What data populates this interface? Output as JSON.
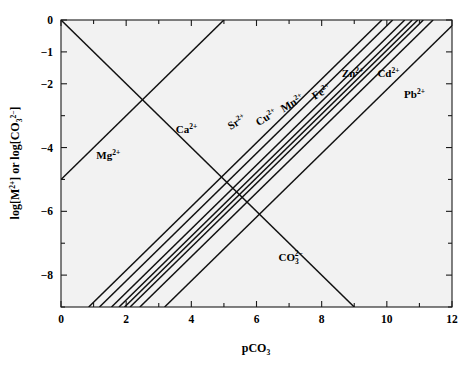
{
  "chart_data": {
    "type": "line",
    "title": "",
    "xlabel": "pCO3",
    "ylabel": "log[M2+] or log[CO3 2-]",
    "xlim": [
      0,
      12
    ],
    "ylim": [
      -9,
      0
    ],
    "grid": false,
    "legend": "inline-annotations",
    "xticks": [
      0,
      2,
      4,
      6,
      8,
      10,
      12
    ],
    "xtick_labels": [
      "0",
      "2",
      "4",
      "6",
      "8",
      "10",
      "12"
    ],
    "xminor_ticks": [
      1,
      3,
      5,
      7,
      9,
      11
    ],
    "yticks": [
      0,
      -1,
      -2,
      -4,
      -6,
      -8
    ],
    "ytick_labels": [
      "0",
      "−1",
      "−2",
      "−4",
      "−6",
      "−8"
    ],
    "yminor_ticks": [
      -3,
      -5,
      -7,
      -9
    ],
    "series": [
      {
        "name": "Mg2+",
        "label": "Mg",
        "charge": "2+",
        "slope": 1,
        "x_intercept": -5.0,
        "points": [
          [
            0,
            -5.0
          ],
          [
            9.0,
            0.0
          ]
        ],
        "label_pos": [
          1.45,
          -4.35
        ],
        "label_rotation": 0
      },
      {
        "name": "Ca2+",
        "label": "Ca",
        "charge": "2+",
        "slope": 1,
        "x_intercept": 0.85,
        "points": [
          [
            0.85,
            -9.0
          ],
          [
            9.85,
            0.0
          ]
        ],
        "label_pos": [
          3.85,
          -3.55
        ],
        "label_rotation": 0
      },
      {
        "name": "Sr2+",
        "label": "Sr",
        "charge": "2+",
        "slope": 1,
        "x_intercept": 1.18,
        "points": [
          [
            1.18,
            -9.0
          ],
          [
            10.18,
            0.0
          ]
        ],
        "label_pos": [
          5.45,
          -3.3
        ],
        "label_rotation": -31
      },
      {
        "name": "Cu2+",
        "label": "Cu",
        "charge": "2+",
        "slope": 1,
        "x_intercept": 1.55,
        "points": [
          [
            1.55,
            -9.0
          ],
          [
            10.55,
            0.0
          ]
        ],
        "label_pos": [
          6.35,
          -3.15
        ],
        "label_rotation": -31
      },
      {
        "name": "Mn2+",
        "label": "Mn",
        "charge": "2+",
        "slope": 1,
        "x_intercept": 1.78,
        "points": [
          [
            1.78,
            -9.0
          ],
          [
            10.78,
            0.0
          ]
        ],
        "label_pos": [
          7.15,
          -2.7
        ],
        "label_rotation": -31
      },
      {
        "name": "Fe2+",
        "label": "Fe",
        "charge": "2+",
        "slope": 1,
        "x_intercept": 1.95,
        "points": [
          [
            1.95,
            -9.0
          ],
          [
            10.95,
            0.0
          ]
        ],
        "label_pos": [
          8.05,
          -2.35
        ],
        "label_rotation": -31
      },
      {
        "name": "Zn2+",
        "label": "Zn",
        "charge": "2+",
        "slope": 1,
        "x_intercept": 2.12,
        "points": [
          [
            2.12,
            -9.0
          ],
          [
            11.12,
            0.0
          ]
        ],
        "label_pos": [
          8.95,
          -1.8
        ],
        "label_rotation": 0
      },
      {
        "name": "Cd2+",
        "label": "Cd",
        "charge": "2+",
        "slope": 1,
        "x_intercept": 2.42,
        "points": [
          [
            2.42,
            -9.0
          ],
          [
            11.42,
            0.0
          ]
        ],
        "label_pos": [
          10.05,
          -1.8
        ],
        "label_rotation": 0
      },
      {
        "name": "Pb2+",
        "label": "Pb",
        "charge": "2+",
        "slope": 1,
        "x_intercept": 3.18,
        "points": [
          [
            3.18,
            -9.0
          ],
          [
            12.0,
            -0.18
          ]
        ],
        "label_pos": [
          10.85,
          -2.45
        ],
        "label_rotation": 0
      },
      {
        "name": "CO3 2-",
        "label": "CO",
        "charge": "2−",
        "subscript": "3",
        "slope": -1,
        "x_intercept": 0.0,
        "points": [
          [
            0.0,
            0.0
          ],
          [
            9.0,
            -9.0
          ]
        ],
        "label_pos": [
          7.05,
          -7.55
        ],
        "label_rotation": 0
      }
    ]
  },
  "axes": {
    "x_title_text": "pCO",
    "x_title_sub": "3",
    "y_title_part1": "log[M",
    "y_title_part1_sup": "2+",
    "y_title_mid": "] or log[CO",
    "y_title_sub": "3",
    "y_title_sup2": "2−",
    "y_title_end": "]"
  }
}
